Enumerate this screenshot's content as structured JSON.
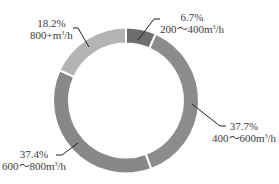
{
  "chart_data": {
    "type": "pie",
    "variant": "donut",
    "title": "",
    "start_angle_deg": 0,
    "direction": "clockwise",
    "categories": [
      "200~400m³/h",
      "400~600m³/h",
      "600~800m³/h",
      "800+m³/h"
    ],
    "values": [
      6.7,
      37.7,
      37.4,
      18.2
    ],
    "unit": "%",
    "colors": [
      "#6e6e6e",
      "#8c8c8c",
      "#888888",
      "#b4b4b4"
    ],
    "legend": "none",
    "labels": [
      {
        "pct": "6.7%",
        "range": "200～400m",
        "sup": "3",
        "suffix": "/h"
      },
      {
        "pct": "37.7%",
        "range": "400～600m",
        "sup": "3",
        "suffix": "/h"
      },
      {
        "pct": "37.4%",
        "range": "600～800m",
        "sup": "3",
        "suffix": "/h"
      },
      {
        "pct": "18.2%",
        "range": "800+m",
        "sup": "3",
        "suffix": "/h"
      }
    ]
  }
}
